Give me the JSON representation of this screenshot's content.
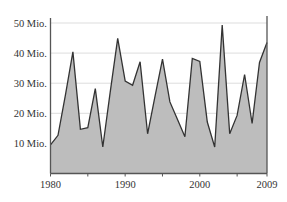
{
  "chart_data": {
    "type": "area",
    "title": "",
    "xlabel": "",
    "ylabel": "",
    "x": [
      1980,
      1981,
      1982,
      1983,
      1984,
      1985,
      1986,
      1987,
      1988,
      1989,
      1990,
      1991,
      1992,
      1993,
      1994,
      1995,
      1996,
      1997,
      1998,
      1999,
      2000,
      2001,
      2002,
      2003,
      2004,
      2005,
      2006,
      2007,
      2008,
      2009
    ],
    "series": [
      {
        "name": "Value",
        "values": [
          9.5,
          12.7,
          26,
          40.4,
          14.7,
          15.2,
          28.2,
          8.8,
          27,
          44.9,
          30.7,
          29.3,
          37.1,
          13.2,
          25.6,
          38.0,
          23.8,
          18,
          12.2,
          38.2,
          37.2,
          17.1,
          8.8,
          49.3,
          13.2,
          19.3,
          32.9,
          16.6,
          36.9,
          43.5
        ]
      }
    ],
    "ylim": [
      0,
      50
    ],
    "xlim": [
      1980,
      2009
    ],
    "yticks": [
      10,
      20,
      30,
      40,
      50
    ],
    "ytick_labels": [
      "10 Mio.",
      "20 Mio.",
      "30 Mio.",
      "40 Mio.",
      "50 Mio."
    ],
    "xticks": [
      1980,
      1985,
      1990,
      1995,
      2000,
      2005,
      2009
    ],
    "xtick_labels": [
      "1980",
      "1990",
      "2000",
      "2009"
    ],
    "grid": true,
    "legend": "none",
    "fill_color": "#bdbdbd",
    "line_color": "#333333",
    "grid_color": "#dddddd"
  }
}
